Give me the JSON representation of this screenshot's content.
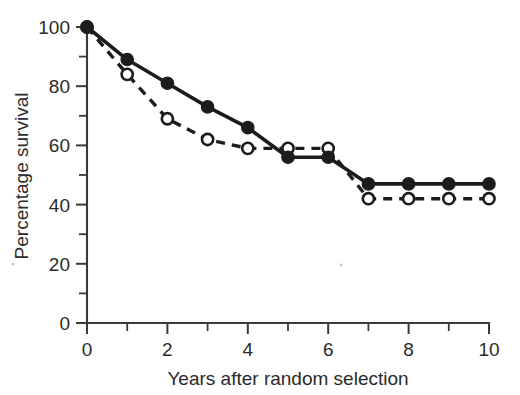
{
  "figure": {
    "background_color": "#ffffff",
    "ink_color": "#1c1c1c"
  },
  "axes": {
    "x_title": "Years after random selection",
    "y_title": "Percentage survival",
    "x_ticks": [
      "0",
      "2",
      "4",
      "6",
      "8",
      "10"
    ],
    "y_ticks": [
      "0",
      "20",
      "40",
      "60",
      "80",
      "100"
    ]
  },
  "chart_data": {
    "type": "line",
    "title": "",
    "xlabel": "Years after random selection",
    "ylabel": "Percentage survival",
    "xlim": [
      0,
      10
    ],
    "ylim": [
      0,
      100
    ],
    "x": [
      0,
      1,
      2,
      3,
      4,
      5,
      6,
      7,
      8,
      9,
      10
    ],
    "xticks": [
      0,
      2,
      4,
      6,
      8,
      10
    ],
    "xminorticks": [
      1,
      3,
      5,
      7,
      9
    ],
    "yticks": [
      0,
      20,
      40,
      60,
      80,
      100
    ],
    "yminorticks": [
      10,
      30,
      50,
      70,
      90
    ],
    "grid": false,
    "legend": "none",
    "series": [
      {
        "name": "solid-filled-circles",
        "line_style": "solid",
        "marker": "filled-circle",
        "color": "#1c1c1c",
        "values": [
          100,
          89,
          81,
          73,
          66,
          56,
          56,
          47,
          47,
          47,
          47
        ]
      },
      {
        "name": "dashed-open-circles",
        "line_style": "dashed",
        "marker": "open-circle",
        "color": "#1c1c1c",
        "values": [
          100,
          84,
          69,
          62,
          59,
          59,
          59,
          42,
          42,
          42,
          42
        ]
      }
    ]
  }
}
